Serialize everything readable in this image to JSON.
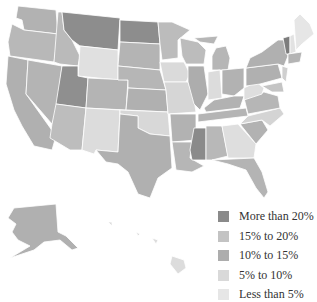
{
  "map": {
    "title": "",
    "type": "choropleth",
    "region": "United States"
  },
  "colors": {
    "more_than_20": "#8a8a8a",
    "15_to_20": "#b5b5b5",
    "10_to_15": "#a9a9a9",
    "5_to_10": "#cfcfcf",
    "less_than_5": "#e2e2e2",
    "border": "#ffffff"
  },
  "legend": {
    "items": [
      {
        "label": "More than 20%",
        "color": "#8a8a8a"
      },
      {
        "label": "15% to 20%",
        "color": "#c3c3c3"
      },
      {
        "label": "10% to 15%",
        "color": "#adadad"
      },
      {
        "label": "5% to 10%",
        "color": "#d9d9d9"
      },
      {
        "label": "Less than 5%",
        "color": "#e6e6e6"
      }
    ]
  },
  "states": {
    "more_than_20": [
      "Montana",
      "North Dakota",
      "Utah",
      "Mississippi",
      "Vermont"
    ],
    "light": [
      "Wyoming",
      "New Mexico",
      "Iowa",
      "Oklahoma",
      "Indiana",
      "Georgia",
      "West Virginia",
      "Maine",
      "New Hampshire",
      "Missouri",
      "Hawaii"
    ],
    "medium": [
      "Washington",
      "Oregon",
      "California",
      "Idaho",
      "Nevada",
      "Arizona",
      "Colorado",
      "South Dakota",
      "Nebraska",
      "Kansas",
      "Texas",
      "Minnesota",
      "Wisconsin",
      "Illinois",
      "Michigan",
      "Ohio",
      "Kentucky",
      "Tennessee",
      "Arkansas",
      "Louisiana",
      "Alabama",
      "Florida",
      "South Carolina",
      "North Carolina",
      "Virginia",
      "Pennsylvania",
      "New York",
      "Alaska"
    ]
  }
}
